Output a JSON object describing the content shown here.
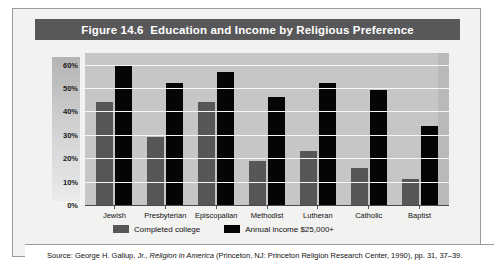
{
  "figure": {
    "title": "Figure 14.6  Education and Income by Religious Preference",
    "source_prefix": "Source: George H. Gallup, Jr., ",
    "source_italic": "Religion in America",
    "source_suffix": " (Princeton, NJ: Princeton Religion Research Center, 1990), pp. 31, 37–39."
  },
  "colors": {
    "title_bar": "#58585a",
    "plot_background": "#c6c6c6",
    "gridline": "#f6f6f6",
    "completed_college": "#575757",
    "annual_income": "#050505",
    "frame_border": "#9a9a9a"
  },
  "chart_data": {
    "type": "bar",
    "title": "Figure 14.6  Education and Income by Religious Preference",
    "xlabel": "",
    "ylabel": "Percentage",
    "ylim": [
      0,
      65
    ],
    "yticks": [
      "0%",
      "10%",
      "20%",
      "30%",
      "40%",
      "50%",
      "60%"
    ],
    "ytick_values": [
      0,
      10,
      20,
      30,
      40,
      50,
      60
    ],
    "grid": true,
    "legend_position": "bottom",
    "categories": [
      "Jewish",
      "Presbyterian",
      "Episcopalian",
      "Methodist",
      "Lutheran",
      "Catholic",
      "Baptist"
    ],
    "series": [
      {
        "name": "Completed college",
        "color": "#575757",
        "values": [
          44,
          29,
          44,
          19,
          23,
          16,
          11
        ]
      },
      {
        "name": "Annual income $25,000+",
        "color": "#050505",
        "values": [
          60,
          52,
          57,
          46,
          52,
          49,
          34
        ]
      }
    ]
  }
}
